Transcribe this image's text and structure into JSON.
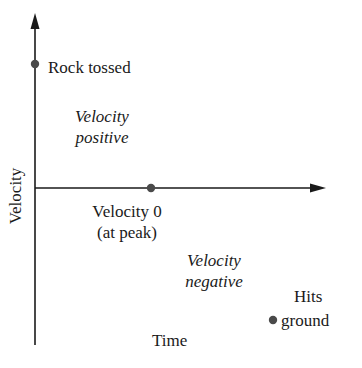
{
  "diagram": {
    "title": "",
    "axes": {
      "x_label": "Time",
      "y_label": "Velocity"
    },
    "points": [
      {
        "id": "rock-tossed",
        "label": "Rock tossed"
      },
      {
        "id": "peak",
        "label_line1": "Velocity 0",
        "label_line2": "(at peak)"
      },
      {
        "id": "hits-ground",
        "label_line1": "Hits",
        "label_line2": "ground"
      }
    ],
    "regions": [
      {
        "id": "positive",
        "line1": "Velocity",
        "line2": "positive"
      },
      {
        "id": "negative",
        "line1": "Velocity",
        "line2": "negative"
      }
    ],
    "colors": {
      "axis": "#1a1a1a",
      "dot": "#4a4a4a",
      "text": "#1a1a1a"
    }
  }
}
